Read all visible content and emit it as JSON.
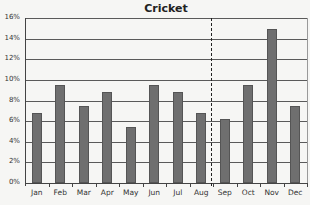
{
  "chart_data": {
    "type": "bar",
    "title": "Cricket",
    "xlabel": "",
    "ylabel": "",
    "categories": [
      "Jan",
      "Feb",
      "Mar",
      "Apr",
      "May",
      "Jun",
      "Jul",
      "Aug",
      "Sep",
      "Oct",
      "Nov",
      "Dec"
    ],
    "values": [
      6.8,
      9.5,
      7.5,
      8.8,
      5.4,
      9.5,
      8.8,
      6.8,
      6.2,
      9.5,
      14.9,
      7.5
    ],
    "unit": "%",
    "ylim": [
      0,
      16
    ],
    "yticks": [
      "0%",
      "2%",
      "4%",
      "6%",
      "8%",
      "10%",
      "12%",
      "14%",
      "16%"
    ],
    "grid": true,
    "legend": null,
    "annotations": [
      {
        "type": "vertical-dashed-line",
        "position": "between Aug and Sep"
      }
    ],
    "colors": {
      "bar": "#6f6f6f",
      "grid": "#5a5a5a",
      "background": "#f6f6f4"
    }
  }
}
